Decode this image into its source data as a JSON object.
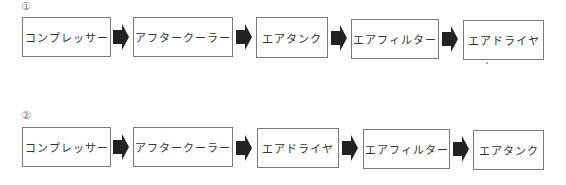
{
  "rows": [
    {
      "marker": "①",
      "steps": [
        "コンプレッサー",
        "アフタークーラー",
        "エアタンク",
        "エアフィルター",
        "エアドライヤ"
      ]
    },
    {
      "marker": "②",
      "steps": [
        "コンプレッサー",
        "アフタークーラー",
        "エアドライヤ",
        "エアフィルター",
        "エアタンク"
      ]
    }
  ],
  "arrow_icon": "right-block-arrow",
  "colors": {
    "box_border": "#7a7a7a",
    "arrow": "#222222",
    "text": "#333333"
  }
}
